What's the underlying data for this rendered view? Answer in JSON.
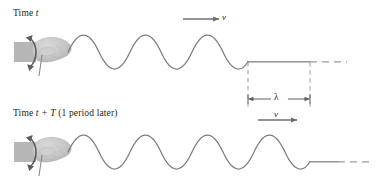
{
  "figure": {
    "kind": "physics-diagram",
    "background_color": "#ffffff",
    "stroke_color": "#7d7d7d",
    "dash_color": "#9a9a9a",
    "text_color": "#231f20",
    "hand_fill": "#c9c9c9",
    "sleeve_fill": "#b3b3b3",
    "arrow_color": "#6f6f6f"
  },
  "panels": [
    {
      "id": "top",
      "title_prefix": "Time ",
      "title_symbol": "t",
      "title_suffix": "",
      "baseline_y": 52,
      "wave": {
        "amplitude": 17,
        "wavelength": 62,
        "start_x": 68,
        "end_x": 248,
        "cycles": 2.9
      },
      "flat_segment": {
        "x1": 248,
        "x2": 310
      },
      "dashed_tail": {
        "x1": 310,
        "x2": 347
      },
      "velocity_label": "v",
      "velocity_arrow": {
        "x1": 183,
        "x2": 222,
        "y": 19
      }
    },
    {
      "id": "bottom",
      "title_prefix": "Time ",
      "title_symbol": "t + T",
      "title_suffix": " (1 period later)",
      "baseline_y": 152,
      "wave": {
        "amplitude": 17,
        "wavelength": 62,
        "start_x": 68,
        "end_x": 310,
        "cycles": 3.9
      },
      "flat_segment": {
        "x1": 310,
        "x2": 338
      },
      "dashed_tail": {
        "x1": 338,
        "x2": 372
      },
      "velocity_label": "v",
      "velocity_arrow": {
        "x1": 258,
        "x2": 300,
        "y": 120
      }
    }
  ],
  "wavelength_marker": {
    "symbol": "λ",
    "x1": 248,
    "x2": 310,
    "y": 99,
    "guide_lines": [
      {
        "x": 248,
        "y1": 52,
        "y2": 108
      },
      {
        "x": 310,
        "y1": 52,
        "y2": 108
      }
    ]
  },
  "hands": [
    {
      "panel": "top",
      "cx": 40,
      "cy": 52,
      "motion_arrow": "double-headed-vertical-curved"
    },
    {
      "panel": "bottom",
      "cx": 40,
      "cy": 152,
      "motion_arrow": "double-headed-vertical-curved"
    }
  ],
  "icon_names": {
    "hand": "hand-icon",
    "sleeve": "sleeve-icon",
    "oscillation_arrow": "up-down-curved-arrow-icon",
    "velocity_arrow": "velocity-arrow-icon",
    "wavelength_dimension": "wavelength-dimension-icon"
  }
}
